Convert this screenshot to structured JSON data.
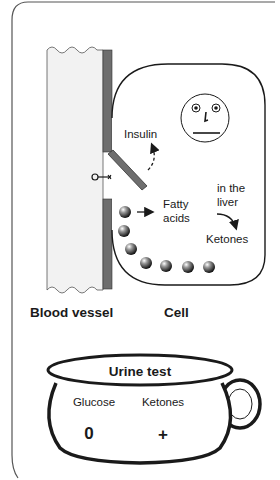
{
  "diagram": {
    "labels": {
      "insulin": "Insulin",
      "fatty_acids_line1": "Fatty",
      "fatty_acids_line2": "acids",
      "in_the_liver_line1": "in the",
      "in_the_liver_line2": "liver",
      "ketones": "Ketones",
      "blood_vessel": "Blood vessel",
      "cell": "Cell"
    },
    "cell_face": {
      "expression": "neutral"
    },
    "fat_droplet_count": 8,
    "urine_test": {
      "title": "Urine test",
      "columns": [
        {
          "label": "Glucose",
          "value": "0"
        },
        {
          "label": "Ketones",
          "value": "+"
        }
      ]
    },
    "colors": {
      "ink": "#1a1a1a",
      "vessel_fill": "#f2f2f2",
      "membrane": "#6e6e6e",
      "frame": "#555555"
    },
    "icons": {
      "key": "key-icon",
      "droplet": "fat-droplet-icon",
      "face": "face-icon"
    }
  }
}
